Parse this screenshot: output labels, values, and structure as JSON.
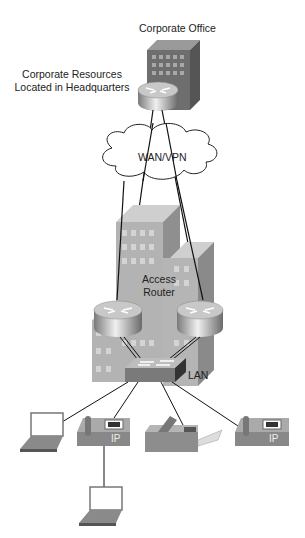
{
  "diagram": {
    "type": "network-topology",
    "nodes": {
      "corporate_office": {
        "label": "Corporate Office"
      },
      "corporate_resources": {
        "label_line1": "Corporate Resources",
        "label_line2": "Located in Headquarters"
      },
      "wan": {
        "label": "WAN/VPN"
      },
      "access_router": {
        "label_line1": "Access",
        "label_line2": "Router"
      },
      "lan": {
        "label": "LAN"
      },
      "ip_phone_label": "IP"
    },
    "devices": [
      "hq-building",
      "hq-router",
      "wan-cloud",
      "branch-building",
      "access-router-left",
      "access-router-right",
      "lan-switch",
      "laptop-1",
      "ip-phone-1",
      "fax-machine",
      "ip-phone-2",
      "laptop-2"
    ],
    "colors": {
      "line": "#111111",
      "building_light": "#b8b8b8",
      "building_dark": "#8a8a8a",
      "hq_front": "#6e6e6e",
      "router_top": "#c8c8c8",
      "switch_front": "#7a7a7a"
    }
  }
}
